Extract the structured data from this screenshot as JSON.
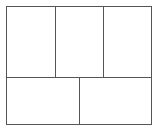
{
  "diagram": {
    "type": "grid-layout",
    "stroke": "#555555",
    "outer": {
      "x": 6,
      "y": 6,
      "w": 145,
      "h": 118
    },
    "top_row": {
      "cells": 3,
      "dividers_x": [
        55,
        103
      ],
      "bottom_y": 77
    },
    "bottom_row": {
      "cells": 2,
      "dividers_x": [
        79
      ]
    }
  }
}
